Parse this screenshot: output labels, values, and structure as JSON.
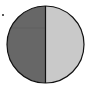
{
  "figure": {
    "type": "split-circle",
    "center": [
      45.5,
      44.5
    ],
    "radius": 38.5,
    "left_half_color": "#676767",
    "right_half_color": "#c9c9c9",
    "outline_color": "#111111",
    "divider": "vertical"
  },
  "marker": {
    "symbol": "dot"
  }
}
